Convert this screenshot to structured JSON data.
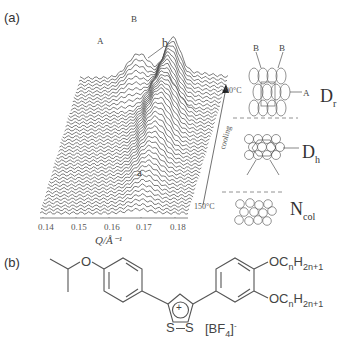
{
  "figure": {
    "panel_a_label": "(a)",
    "panel_b_label": "(b)"
  },
  "chart_data": {
    "type": "waterfall",
    "title": "",
    "xlabel": "Q/Å⁻¹",
    "x_ticks": [
      "0.14",
      "0.15",
      "0.16",
      "0.17",
      "0.18"
    ],
    "xlim": [
      0.137,
      0.185
    ],
    "n_traces": 40,
    "temperature_start": "150°C",
    "temperature_end": "90°C",
    "direction_label": "cooling",
    "peak_labels": [
      {
        "label": "A",
        "q": 0.156,
        "note": "low-temperature peak"
      },
      {
        "label": "B",
        "q": 0.167,
        "note": "low-temperature peak"
      },
      {
        "label": "a",
        "q": 0.169,
        "note": "high-temperature single peak"
      },
      {
        "label": "b",
        "q": 0.172,
        "note": "transition annotation"
      }
    ],
    "phases": [
      {
        "name": "D",
        "sub": "r",
        "description": "rectangular columnar",
        "labels": [
          "B",
          "B",
          "A"
        ]
      },
      {
        "name": "D",
        "sub": "h",
        "description": "hexagonal columnar"
      },
      {
        "name": "N",
        "sub": "col",
        "description": "columnar nematic"
      }
    ]
  },
  "molecule": {
    "substituent_top": "OC",
    "sub_n": "n",
    "H": "H",
    "sub_2n1": "2n+1",
    "ring_charge": "+",
    "S": "S",
    "O": "O",
    "counterion": "[BF",
    "counterion_sub": "4",
    "counterion_close": "]",
    "counterion_sup": "-"
  }
}
